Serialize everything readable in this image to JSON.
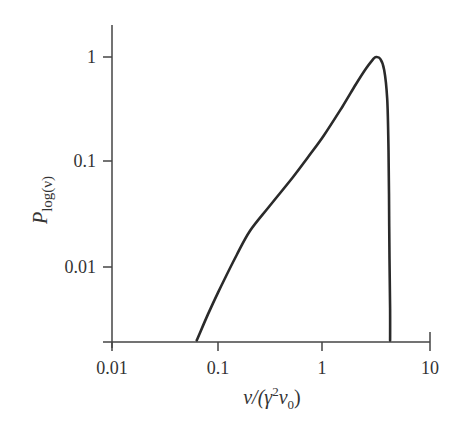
{
  "chart_data": {
    "type": "line",
    "title": "",
    "xlabel": "ν/(γ²ν₀)",
    "ylabel": "P_log(ν)",
    "xscale": "log",
    "yscale": "log",
    "xlim": [
      0.01,
      10
    ],
    "ylim": [
      0.002,
      1.6
    ],
    "grid": false,
    "legend": null,
    "x_ticks": [
      0.01,
      0.1,
      1,
      10
    ],
    "x_tick_labels": [
      "0.01",
      "0.1",
      "1",
      "10"
    ],
    "y_ticks": [
      0.01,
      0.1,
      1
    ],
    "y_tick_labels": [
      "0.01",
      "0.1",
      "1"
    ],
    "series": [
      {
        "name": "P_log(ν)",
        "x": [
          0.063,
          0.08,
          0.1,
          0.15,
          0.2,
          0.3,
          0.5,
          0.7,
          1.0,
          1.5,
          2.0,
          2.5,
          2.9,
          3.1,
          3.4,
          3.7,
          3.95,
          4.05,
          4.1,
          4.15,
          4.2,
          4.2
        ],
        "y": [
          0.002,
          0.0035,
          0.0057,
          0.013,
          0.022,
          0.037,
          0.07,
          0.11,
          0.18,
          0.34,
          0.55,
          0.78,
          0.95,
          1.0,
          0.96,
          0.75,
          0.4,
          0.15,
          0.05,
          0.012,
          0.004,
          0.002
        ]
      }
    ]
  },
  "axes": {
    "x_title_main": "ν/(γ",
    "x_title_sup": "2",
    "x_title_mid": "ν",
    "x_title_sub": "0",
    "x_title_end": ")",
    "y_title_main": "P",
    "y_title_sub": "log(ν)",
    "x_tick_labels": [
      "0.01",
      "0.1",
      "1",
      "10"
    ],
    "y_tick_labels": [
      "1",
      "0.1",
      "0.01"
    ]
  },
  "colors": {
    "axis": "#444444",
    "curve": "#2a2a2a",
    "text": "#333333"
  }
}
